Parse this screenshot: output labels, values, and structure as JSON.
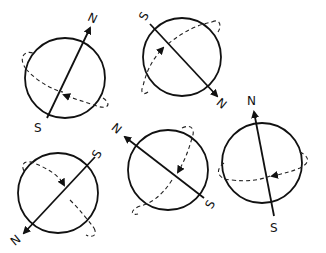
{
  "diagram": {
    "spheres": [
      {
        "id": 1,
        "north_label": "N",
        "south_label": "S"
      },
      {
        "id": 2,
        "north_label": "N",
        "south_label": "S"
      },
      {
        "id": 3,
        "north_label": "N",
        "south_label": "S"
      },
      {
        "id": 4,
        "north_label": "N",
        "south_label": "S"
      },
      {
        "id": 5,
        "north_label": "N",
        "south_label": "S"
      }
    ]
  }
}
